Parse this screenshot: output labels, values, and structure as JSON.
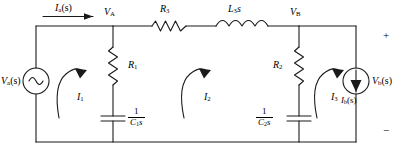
{
  "diagram": {
    "type": "circuit-schematic",
    "stroke_color": "#1a1a1a",
    "background_color": "#ffffff",
    "width": 403,
    "height": 153
  },
  "sources": {
    "input_voltage": {
      "label_v": "V",
      "label_sub": "a",
      "label_arg": "(s)",
      "symbol": "ac-voltage-source",
      "full_label": "Va(s)"
    },
    "output_current": {
      "label_i": "I",
      "label_sub": "b",
      "label_arg": "(s)",
      "symbol": "current-source-down",
      "full_label": "Ib(s)"
    },
    "output_voltage": {
      "label_v": "V",
      "label_sub": "b",
      "label_arg": "(s)",
      "full_label": "Vb(s)"
    }
  },
  "input_current": {
    "label_i": "I",
    "label_sub": "a",
    "label_arg": "(s)",
    "full_label": "Ia(s)",
    "direction": "right"
  },
  "nodes": [
    {
      "name": "node-a",
      "label_v": "V",
      "label_sub": "A",
      "full_label": "VA"
    },
    {
      "name": "node-b",
      "label_v": "V",
      "label_sub": "B",
      "full_label": "VB"
    }
  ],
  "components": {
    "resistor_r1": {
      "label_r": "R",
      "label_sub": "1",
      "full_label": "R1",
      "kind": "resistor"
    },
    "resistor_r2": {
      "label_r": "R",
      "label_sub": "2",
      "full_label": "R2",
      "kind": "resistor"
    },
    "resistor_r3": {
      "label_r": "R",
      "label_sub": "3",
      "full_label": "R3",
      "kind": "resistor"
    },
    "inductor_l3": {
      "label_l": "L",
      "label_sub": "3",
      "label_s": "s",
      "full_label": "L3s",
      "kind": "inductor"
    },
    "capacitor_c1": {
      "numerator": "1",
      "den_c": "C",
      "den_sub": "1",
      "den_s": "s",
      "full_label": "1/(C1s)",
      "kind": "capacitor"
    },
    "capacitor_c2": {
      "numerator": "1",
      "den_c": "C",
      "den_sub": "2",
      "den_s": "s",
      "full_label": "1/(C2s)",
      "kind": "capacitor"
    }
  },
  "mesh_currents": [
    {
      "name": "mesh-current-1",
      "label_i": "I",
      "label_sub": "1",
      "full_label": "I1"
    },
    {
      "name": "mesh-current-2",
      "label_i": "I",
      "label_sub": "2",
      "full_label": "I2"
    },
    {
      "name": "mesh-current-3",
      "label_i": "I",
      "label_sub": "3",
      "full_label": "I3"
    }
  ],
  "polarity": {
    "plus": "+",
    "minus": "−"
  }
}
